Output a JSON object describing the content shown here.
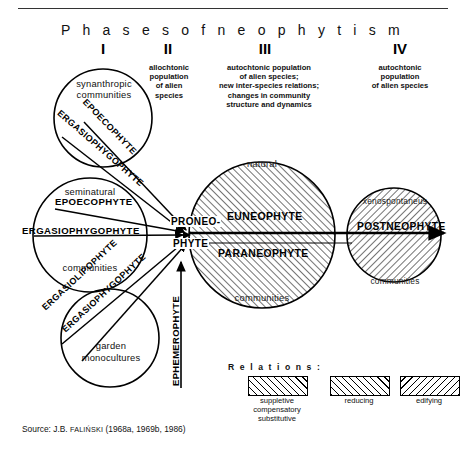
{
  "header": {
    "title": "P h a s e s   o f   n e o p h y t i s m",
    "title_plain": "Phases of neophytism",
    "numerals": [
      {
        "label": "I",
        "x": 103
      },
      {
        "label": "II",
        "x": 168
      },
      {
        "label": "III",
        "x": 265
      },
      {
        "label": "IV",
        "x": 400
      }
    ],
    "phase_descriptions": [
      {
        "id": "phase-2",
        "lines": [
          "allochtonic",
          "population",
          "of alien",
          "species"
        ]
      },
      {
        "id": "phase-3",
        "lines": [
          "autochtonic population",
          "of alien species;",
          "new inter-species relations;",
          "changes in community",
          "structure and dynamics"
        ]
      },
      {
        "id": "phase-4",
        "lines": [
          "autochtonic",
          "population",
          "of alien species"
        ]
      }
    ]
  },
  "diagram": {
    "circles": [
      {
        "id": "synanthropic",
        "top_label": "synanthropic",
        "top_label2": "communities",
        "bottom_label": "",
        "fill": "none"
      },
      {
        "id": "seminatural",
        "top_label": "seminatural",
        "bottom_label": "communities",
        "fill": "none"
      },
      {
        "id": "garden",
        "top_label": "garden",
        "bottom_label": "monocultures",
        "fill": "none"
      },
      {
        "id": "natural-central",
        "top_label": "natural",
        "bottom_label": "communities",
        "fill": "hatch-suppletive"
      },
      {
        "id": "xenospontaneus",
        "top_label": "xenospontaneus",
        "bottom_label": "communities",
        "fill": "hatch-edifying"
      }
    ],
    "arrow_labels": {
      "epoecophyte_1": "EPOECOPHYTE",
      "ergasiophygophyte_1": "ERGASIOPHYGOPHYTE",
      "epoecophyte_2": "EPOECOPHYTE",
      "ergasiophygophyte_2": "ERGASIOPHYGOPHYTE",
      "ergasiolipophyte": "ERGASIOLIPOPHYTE",
      "ergasiophygophyte_3": "ERGASIOPHYGOPHYTE",
      "ephemerophyte": "EPHEMEROPHYTE",
      "proneo": "PRONEO-",
      "phyte": "PHYTE",
      "euneophyte": "EUNEOPHYTE",
      "paraneophyte": "PARANEOPHYTE",
      "postneophyte": "POSTNEOPHYTE"
    }
  },
  "legend": {
    "title": "R e l a t i o n s :",
    "title_plain": "Relations:",
    "items": [
      {
        "id": "suppletive",
        "pattern": "diagonal-hatch-left",
        "lines": [
          "suppletive",
          "compensatory",
          "substitutive"
        ]
      },
      {
        "id": "reducing",
        "pattern": "cross-hatch",
        "lines": [
          "reducing"
        ]
      },
      {
        "id": "edifying",
        "pattern": "diagonal-hatch-right",
        "lines": [
          "edifying"
        ]
      }
    ]
  },
  "source": {
    "prefix": "Source: J.B. ",
    "author": "FALIŃSKI",
    "years": " (1968a, 1969b, 1986)"
  },
  "colors": {
    "ink": "#000000",
    "paper": "#ffffff",
    "rule": "#333333"
  }
}
